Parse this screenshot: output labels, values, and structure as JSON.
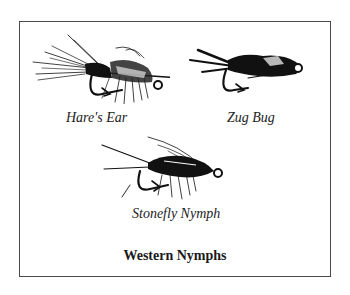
{
  "figure": {
    "title": "Western Nymphs",
    "flies": [
      {
        "name": "Hare's Ear",
        "icon": "hares-ear-fly-icon"
      },
      {
        "name": "Zug Bug",
        "icon": "zug-bug-fly-icon"
      },
      {
        "name": "Stonefly Nymph",
        "icon": "stonefly-nymph-fly-icon"
      }
    ],
    "colors": {
      "ink": "#111111",
      "border": "#4a4a4a",
      "background": "#ffffff"
    }
  }
}
